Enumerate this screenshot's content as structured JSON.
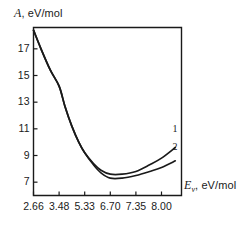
{
  "chart_data": {
    "type": "line",
    "title": "",
    "xlabel": "Ev, eV/mol",
    "ylabel": "A, eV/mol",
    "xlabel_symbol": "E",
    "xlabel_subscript": "v",
    "xlabel_units": ", eV/mol",
    "ylabel_symbol": "A",
    "ylabel_units": ", eV/mol",
    "x_tick_labels": [
      "2.66",
      "3.48",
      "5.33",
      "6.70",
      "7.35",
      "8.00"
    ],
    "x_tick_values": [
      2.66,
      3.48,
      5.33,
      6.7,
      7.35,
      8.0
    ],
    "y_tick_labels": [
      "17",
      "15",
      "13",
      "11",
      "9",
      "7"
    ],
    "y_tick_values": [
      17,
      15,
      13,
      11,
      9,
      7
    ],
    "ylim": [
      6.0,
      18.6
    ],
    "xlim_index": [
      0,
      5.6
    ],
    "grid": false,
    "legend": "inline-curve-numbers",
    "axis_color": "#1a1a1a",
    "curve_color": "#1a1a1a",
    "background": "#ffffff",
    "series": [
      {
        "name": "1",
        "label": "1",
        "x": [
          2.66,
          2.9,
          3.2,
          3.48,
          3.9,
          4.4,
          4.9,
          5.33,
          5.8,
          6.2,
          6.7,
          7.0,
          7.35,
          7.7,
          8.0,
          8.35,
          8.6
        ],
        "values": [
          18.4,
          17.0,
          15.4,
          14.2,
          12.7,
          11.2,
          10.0,
          9.2,
          8.4,
          7.9,
          7.6,
          7.6,
          7.8,
          8.3,
          8.8,
          9.6,
          10.3
        ]
      },
      {
        "name": "2",
        "label": "2",
        "x": [
          2.66,
          2.9,
          3.2,
          3.48,
          3.9,
          4.4,
          4.9,
          5.33,
          5.8,
          6.2,
          6.7,
          7.0,
          7.35,
          7.7,
          8.0,
          8.35,
          8.6
        ],
        "values": [
          18.4,
          17.0,
          15.4,
          14.2,
          12.7,
          11.2,
          10.0,
          9.2,
          8.3,
          7.7,
          7.3,
          7.3,
          7.5,
          7.8,
          8.1,
          8.6,
          9.0
        ]
      }
    ]
  }
}
